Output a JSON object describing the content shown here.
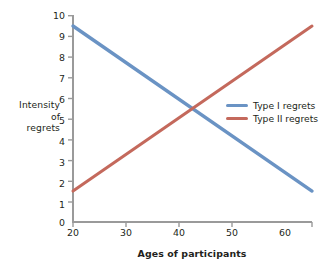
{
  "chart_data": {
    "type": "line",
    "title": "",
    "xlabel": "Ages of participants",
    "ylabel": "Intensity of regrets",
    "ylabel_lines": [
      "Intensity",
      "of",
      "regrets"
    ],
    "x": [
      20,
      60
    ],
    "xlim": [
      20,
      60
    ],
    "ylim": [
      0,
      10
    ],
    "xticks": [
      "20",
      "30",
      "40",
      "50",
      "60"
    ],
    "xtick_values": [
      20,
      30,
      40,
      50,
      60
    ],
    "yticks": [
      "0",
      "1",
      "2",
      "3",
      "4",
      "5",
      "6",
      "7",
      "8",
      "9",
      "10"
    ],
    "ytick_values": [
      0,
      1,
      2,
      3,
      4,
      5,
      6,
      7,
      8,
      9,
      10
    ],
    "grid": false,
    "legend_position": "center-right",
    "series": [
      {
        "name": "Type I regrets",
        "color": "#6a93c4",
        "x": [
          20,
          60
        ],
        "values": [
          9.5,
          1.5
        ]
      },
      {
        "name": "Type II regrets",
        "color": "#c4695c",
        "x": [
          20,
          60
        ],
        "values": [
          1.5,
          9.5
        ]
      }
    ],
    "intersection": {
      "x": 40,
      "y": 5.5
    },
    "axis_color": "#9a9a9a"
  },
  "legend": {
    "items": [
      {
        "label": "Type I regrets",
        "color": "#6a93c4"
      },
      {
        "label": "Type II regrets",
        "color": "#c4695c"
      }
    ]
  }
}
